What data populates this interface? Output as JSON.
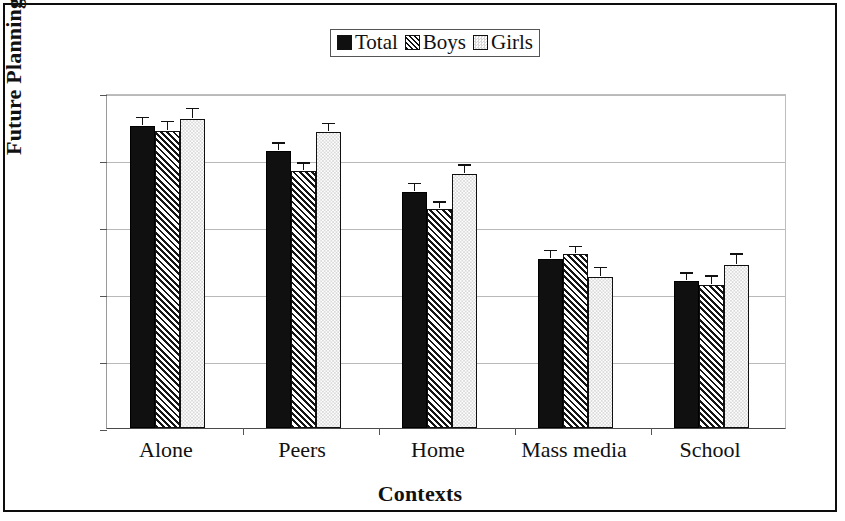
{
  "chart_data": {
    "type": "bar",
    "title": "",
    "xlabel": "Contexts",
    "ylabel": "Future Planning",
    "ylim": [
      0,
      5
    ],
    "yticks": [
      0,
      1,
      2,
      3,
      4,
      5
    ],
    "grid": true,
    "legend_position": "top-center",
    "categories": [
      "Alone",
      "Peers",
      "Home",
      "Mass media",
      "School"
    ],
    "series": [
      {
        "name": "Total",
        "fill": "solid-black",
        "color": "#101010",
        "values": [
          4.51,
          4.14,
          3.53,
          2.52,
          2.2
        ],
        "errors": [
          0.1,
          0.09,
          0.09,
          0.1,
          0.09
        ]
      },
      {
        "name": "Boys",
        "fill": "diagonal-hatch",
        "color": "#151515",
        "values": [
          4.43,
          3.84,
          3.27,
          2.59,
          2.13
        ],
        "errors": [
          0.12,
          0.09,
          0.08,
          0.09,
          0.11
        ]
      },
      {
        "name": "Girls",
        "fill": "light-dotted",
        "color": "#dadada",
        "values": [
          4.61,
          4.42,
          3.79,
          2.26,
          2.44
        ],
        "errors": [
          0.13,
          0.1,
          0.11,
          0.11,
          0.13
        ]
      }
    ]
  }
}
